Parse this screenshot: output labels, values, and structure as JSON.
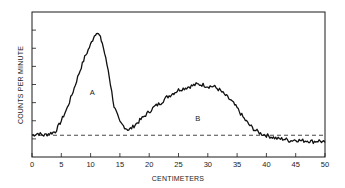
{
  "chart_data": {
    "type": "line",
    "title": "",
    "xlabel": "CENTIMETERS",
    "ylabel": "COUNTS PER MINUTE",
    "xlim": [
      0,
      50
    ],
    "ylim": [
      0,
      8
    ],
    "x_ticks": [
      0,
      5,
      10,
      15,
      20,
      25,
      30,
      35,
      40,
      45,
      50
    ],
    "x_tick_labels": [
      "0",
      "5",
      "10",
      "15",
      "20",
      "25",
      "30",
      "35",
      "40",
      "45",
      "50"
    ],
    "y_ticks": [
      1,
      2,
      3,
      4,
      5,
      6,
      7
    ],
    "y_tick_labels": [],
    "grid": false,
    "legend": null,
    "series": [
      {
        "name": "counts",
        "x": [
          0,
          1,
          2,
          3,
          4,
          5,
          6,
          7,
          8,
          9,
          10,
          10.5,
          11,
          11.5,
          12,
          13,
          14,
          15,
          16,
          16.5,
          17,
          18,
          19,
          20,
          21,
          22,
          23,
          24,
          25,
          26,
          27,
          28,
          29,
          30,
          31,
          32,
          33,
          34,
          35,
          36,
          37,
          38,
          39,
          40,
          41,
          42,
          43,
          44,
          45,
          46,
          47,
          48,
          49,
          50
        ],
        "y": [
          1.2,
          1.3,
          1.2,
          1.3,
          1.4,
          2.0,
          2.7,
          3.6,
          4.6,
          5.5,
          6.2,
          6.6,
          6.9,
          6.7,
          6.3,
          4.8,
          2.8,
          1.9,
          1.6,
          1.5,
          1.6,
          1.9,
          2.2,
          2.5,
          2.8,
          3.0,
          3.3,
          3.5,
          3.7,
          3.8,
          3.9,
          4.0,
          4.0,
          3.9,
          3.9,
          3.7,
          3.4,
          3.1,
          2.7,
          2.2,
          1.8,
          1.5,
          1.3,
          1.2,
          1.1,
          1.0,
          1.0,
          0.9,
          0.95,
          0.9,
          0.9,
          0.85,
          0.9,
          0.8
        ]
      },
      {
        "name": "baseline",
        "style": "dashed",
        "x": [
          0,
          50
        ],
        "y": [
          1.2,
          1.2
        ]
      }
    ],
    "annotations": [
      {
        "text": "A",
        "x": 10.3,
        "y": 3.4
      },
      {
        "text": "B",
        "x": 28.3,
        "y": 2.0
      }
    ]
  }
}
